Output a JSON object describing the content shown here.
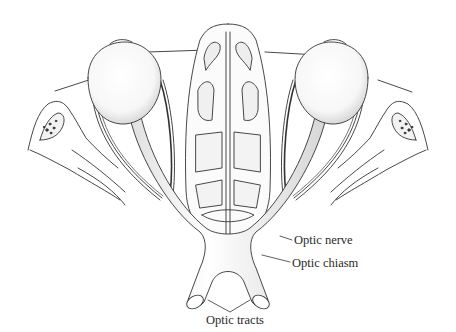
{
  "figure": {
    "colors": {
      "line": "#333333",
      "shade": "#bdbdbd",
      "background": "#ffffff"
    },
    "labels": {
      "optic_nerve": "Optic nerve",
      "optic_chiasm": "Optic chiasm",
      "optic_tracts": "Optic tracts"
    }
  }
}
